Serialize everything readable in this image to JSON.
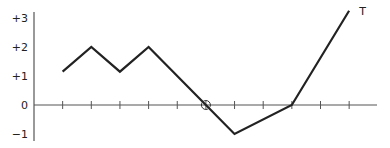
{
  "chart_data": {
    "type": "line",
    "title": "",
    "xlabel": "",
    "ylabel": "",
    "x": [
      1,
      2,
      3,
      4,
      6,
      7,
      9,
      11
    ],
    "series": [
      {
        "name": "T",
        "points": [
          [
            1,
            1.15
          ],
          [
            2,
            2
          ],
          [
            3,
            1.15
          ],
          [
            4,
            2
          ],
          [
            6,
            0
          ],
          [
            7,
            -1
          ],
          [
            9,
            0
          ],
          [
            11,
            3.25
          ]
        ]
      }
    ],
    "x_ticks": [
      1,
      2,
      3,
      4,
      5,
      6,
      7,
      8,
      9,
      10,
      11
    ],
    "y_ticks": [
      {
        "value": 3,
        "label": "+3"
      },
      {
        "value": 2,
        "label": "+2"
      },
      {
        "value": 1,
        "label": "+1"
      },
      {
        "value": 0,
        "label": "0"
      },
      {
        "value": -1,
        "label": "−1"
      }
    ],
    "ylim": [
      -1.25,
      3.3
    ],
    "xlim": [
      0,
      12
    ],
    "annotations": [
      {
        "type": "circle-marker",
        "x": 6,
        "y": 0
      },
      {
        "type": "text",
        "text": "T",
        "x": 11.35,
        "y": 3.25
      }
    ],
    "grid": false,
    "legend": "none",
    "colors": {
      "line": "#222222",
      "axis": "#555555"
    }
  }
}
